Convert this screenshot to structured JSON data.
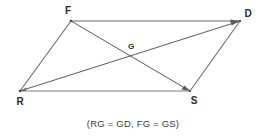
{
  "figure": {
    "shape_name": "parallelogram",
    "background_color": "#ffffff",
    "stroke_color_sides": "#9a9a9a",
    "stroke_color_diagonals": "#555555",
    "label_color": "#2b2b2b",
    "vertices": [
      {
        "id": "F",
        "label": "F",
        "x": 71,
        "y": 21,
        "label_x": 68,
        "label_y": 14
      },
      {
        "id": "D",
        "label": "D",
        "x": 240,
        "y": 21,
        "label_x": 248,
        "label_y": 17
      },
      {
        "id": "S",
        "label": "S",
        "x": 190,
        "y": 91,
        "label_x": 194,
        "label_y": 104
      },
      {
        "id": "R",
        "label": "R",
        "x": 20,
        "y": 91,
        "label_x": 20,
        "label_y": 105
      }
    ],
    "interior_points": [
      {
        "id": "G",
        "label": "G",
        "x": 130,
        "y": 52,
        "label_x": 128,
        "label_y": 49
      }
    ],
    "sides": [
      {
        "id": "FD",
        "from": "F",
        "to": "D"
      },
      {
        "id": "DS",
        "from": "D",
        "to": "S"
      },
      {
        "id": "SR",
        "from": "S",
        "to": "R"
      },
      {
        "id": "RF",
        "from": "R",
        "to": "F"
      }
    ],
    "diagonals": [
      {
        "id": "RD",
        "from": "R",
        "to": "D"
      },
      {
        "id": "FS",
        "from": "F",
        "to": "S"
      }
    ],
    "caption": "(RG = GD, FG = GS)",
    "caption_x": 133,
    "caption_y": 127
  }
}
